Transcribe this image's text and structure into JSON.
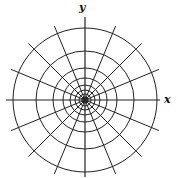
{
  "diagram": {
    "type": "polar-grid",
    "center": [
      85,
      100
    ],
    "circle_radii": [
      72,
      49,
      32,
      22,
      15,
      10,
      6,
      3
    ],
    "radial_line_count": 16,
    "radial_line_length": 80,
    "stroke_color": "#222222",
    "axes": {
      "x": {
        "label": "x",
        "from": [
          6,
          100
        ],
        "to": [
          160,
          100
        ]
      },
      "y": {
        "label": "y",
        "from": [
          85,
          177
        ],
        "to": [
          85,
          17
        ]
      }
    }
  }
}
